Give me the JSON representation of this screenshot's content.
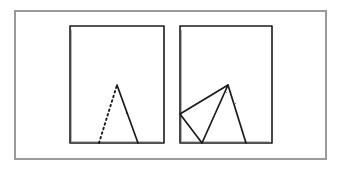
{
  "figure": {
    "title": "Two hand-drawn panels showing a polygon before and after vertex insertion",
    "background_color": "#ffffff",
    "frame": {
      "name": "outer-frame",
      "x": 15,
      "y": 11,
      "width": 311,
      "height": 148,
      "stroke_color": "#9a9a9a",
      "stroke_width": 2,
      "fill": "none"
    },
    "ink_color": "#1a1a1a",
    "panels": [
      {
        "id": "left-panel",
        "label": "left panel",
        "box": {
          "name": "left-panel-box",
          "x": 70,
          "y": 26,
          "width": 94,
          "height": 117,
          "stroke_color": "#1a1a1a",
          "stroke_width": 1.6,
          "fill": "#ffffff"
        },
        "shapes": [
          {
            "id": "left-dotted-leg",
            "label": "dotted left leg",
            "type": "polyline",
            "style": "dotted",
            "dash_pattern": "1.6 3.2",
            "stroke_width": 1.9,
            "points": [
              [
                99,
                143
              ],
              [
                117,
                85
              ]
            ]
          },
          {
            "id": "left-solid-leg",
            "label": "solid right leg",
            "type": "polyline",
            "style": "solid",
            "stroke_width": 1.7,
            "points": [
              [
                117,
                85
              ],
              [
                138,
                143
              ]
            ]
          }
        ]
      },
      {
        "id": "right-panel",
        "label": "right panel",
        "box": {
          "name": "right-panel-box",
          "x": 180,
          "y": 26,
          "width": 92,
          "height": 117,
          "stroke_color": "#1a1a1a",
          "stroke_width": 1.6,
          "fill": "#ffffff"
        },
        "shapes": [
          {
            "id": "right-quad",
            "label": "solid quadrilateral with inserted vertex",
            "type": "polyline",
            "style": "solid",
            "stroke_width": 1.7,
            "points": [
              [
                180,
                114
              ],
              [
                228,
                85
              ],
              [
                202,
                143
              ],
              [
                180,
                114
              ]
            ]
          },
          {
            "id": "right-solid-leg",
            "label": "solid right leg",
            "type": "polyline",
            "style": "solid",
            "stroke_width": 1.7,
            "points": [
              [
                228,
                85
              ],
              [
                246,
                143
              ]
            ]
          }
        ]
      }
    ],
    "vertices": {
      "left_apex": [
        117,
        85
      ],
      "left_dotted_base": [
        99,
        143
      ],
      "left_solid_base": [
        138,
        143
      ],
      "right_apex": [
        228,
        85
      ],
      "right_left_point": [
        180,
        114
      ],
      "right_bottom_point": [
        202,
        143
      ],
      "right_solid_base": [
        246,
        143
      ]
    }
  }
}
